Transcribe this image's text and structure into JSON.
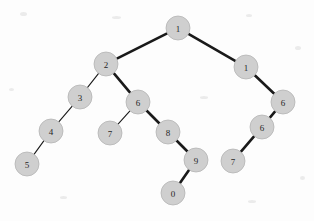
{
  "figure": {
    "kind": "binary-tree-diagram",
    "width": 314,
    "height": 221,
    "background_color": "#fdfdfd",
    "node_fill_color": "#cfcfcf",
    "node_stroke_color": "#b4b4b4",
    "node_label_color": "#262626",
    "edge_color": "#1a1a1a",
    "node_radius": 12
  },
  "nodes": [
    {
      "id": "n1",
      "label": "1",
      "x": 178,
      "y": 28,
      "r": 12
    },
    {
      "id": "n2",
      "label": "2",
      "x": 106,
      "y": 64,
      "r": 12
    },
    {
      "id": "n3",
      "label": "1",
      "x": 246,
      "y": 67,
      "r": 12
    },
    {
      "id": "n4",
      "label": "3",
      "x": 80,
      "y": 97,
      "r": 12
    },
    {
      "id": "n5",
      "label": "6",
      "x": 138,
      "y": 102,
      "r": 12
    },
    {
      "id": "n6",
      "label": "6",
      "x": 283,
      "y": 102,
      "r": 12
    },
    {
      "id": "n7",
      "label": "4",
      "x": 51,
      "y": 131,
      "r": 12
    },
    {
      "id": "n8",
      "label": "7",
      "x": 110,
      "y": 133,
      "r": 12
    },
    {
      "id": "n9",
      "label": "8",
      "x": 168,
      "y": 132,
      "r": 12
    },
    {
      "id": "n10",
      "label": "6",
      "x": 262,
      "y": 127,
      "r": 12
    },
    {
      "id": "n11",
      "label": "5",
      "x": 27,
      "y": 164,
      "r": 12
    },
    {
      "id": "n12",
      "label": "9",
      "x": 196,
      "y": 160,
      "r": 12
    },
    {
      "id": "n13",
      "label": "7",
      "x": 233,
      "y": 161,
      "r": 12
    },
    {
      "id": "n14",
      "label": "0",
      "x": 173,
      "y": 193,
      "r": 12
    }
  ],
  "edges": [
    {
      "id": "e1",
      "from": "n1",
      "to": "n2",
      "width": 2.6
    },
    {
      "id": "e2",
      "from": "n1",
      "to": "n3",
      "width": 2.6
    },
    {
      "id": "e3",
      "from": "n2",
      "to": "n4",
      "width": 1.1
    },
    {
      "id": "e4",
      "from": "n2",
      "to": "n5",
      "width": 2.6
    },
    {
      "id": "e5",
      "from": "n3",
      "to": "n6",
      "width": 2.6
    },
    {
      "id": "e6",
      "from": "n4",
      "to": "n7",
      "width": 1.1
    },
    {
      "id": "e7",
      "from": "n5",
      "to": "n8",
      "width": 1.1
    },
    {
      "id": "e8",
      "from": "n5",
      "to": "n9",
      "width": 2.6
    },
    {
      "id": "e9",
      "from": "n6",
      "to": "n10",
      "width": 2.6
    },
    {
      "id": "e10",
      "from": "n7",
      "to": "n11",
      "width": 1.1
    },
    {
      "id": "e11",
      "from": "n9",
      "to": "n12",
      "width": 2.6
    },
    {
      "id": "e12",
      "from": "n10",
      "to": "n13",
      "width": 2.6
    },
    {
      "id": "e13",
      "from": "n12",
      "to": "n14",
      "width": 2.6
    }
  ],
  "specks": [
    {
      "x": 20,
      "y": 12,
      "w": 7,
      "h": 4
    },
    {
      "x": 112,
      "y": 16,
      "w": 9,
      "h": 3
    },
    {
      "x": 246,
      "y": 14,
      "w": 6,
      "h": 3
    },
    {
      "x": 295,
      "y": 46,
      "w": 6,
      "h": 4
    },
    {
      "x": 9,
      "y": 88,
      "w": 5,
      "h": 3
    },
    {
      "x": 200,
      "y": 96,
      "w": 8,
      "h": 3
    },
    {
      "x": 60,
      "y": 196,
      "w": 7,
      "h": 3
    },
    {
      "x": 248,
      "y": 200,
      "w": 8,
      "h": 3
    },
    {
      "x": 300,
      "y": 176,
      "w": 5,
      "h": 4
    }
  ]
}
